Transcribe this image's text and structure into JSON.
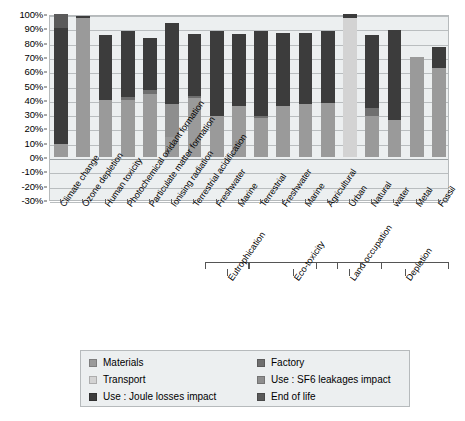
{
  "chart_data": {
    "type": "bar",
    "subtype": "stacked-bar-percentage",
    "title": "",
    "xlabel": "",
    "ylabel": "",
    "ylim": [
      -30,
      100
    ],
    "ytick_labels": [
      "100%",
      "90%",
      "80%",
      "70%",
      "60%",
      "50%",
      "40%",
      "30%",
      "20%",
      "10%",
      "0%",
      "-10%",
      "-20%",
      "-30%"
    ],
    "ytick_values": [
      100,
      90,
      80,
      70,
      60,
      50,
      40,
      30,
      20,
      10,
      0,
      -10,
      -20,
      -30
    ],
    "grid": true,
    "legend_position": "bottom",
    "categories": [
      "Climate change",
      "Ozone depletion",
      "Human toxicity",
      "Photochemical oxidant formation",
      "Particulate matter formation",
      "Ionising radiation",
      "Terrestrial acidification",
      "Freshwater",
      "Marine",
      "Terrestrial",
      "Freshwater",
      "Marine",
      "Agricultural",
      "Urban",
      "Natural",
      "water",
      "Metal",
      "Fossil"
    ],
    "series": [
      {
        "name": "Materials",
        "color": "#9a9a9a",
        "values": [
          9,
          97,
          40,
          40,
          44,
          14,
          41,
          37,
          36,
          28,
          37,
          39,
          39,
          0,
          33,
          28,
          70,
          62
        ]
      },
      {
        "name": "Factory",
        "color": "#6f6f6f",
        "values": [
          0,
          0,
          0,
          1.5,
          3,
          0,
          2,
          0,
          0,
          0,
          0,
          0,
          0,
          0,
          0,
          0,
          0,
          0
        ]
      },
      {
        "name": "Transport",
        "color": "#d3d3d3",
        "values": [
          0,
          0,
          0,
          0,
          0,
          0,
          0,
          0,
          0,
          0,
          0,
          0,
          0,
          97,
          0,
          0,
          0,
          0
        ]
      },
      {
        "name": "Use : SF6 leakages impact",
        "color": "#8e8e8e",
        "values": [
          0,
          0,
          0,
          0,
          0,
          23,
          0,
          0,
          0,
          0,
          0,
          0,
          0,
          0,
          0,
          0,
          0,
          0
        ]
      },
      {
        "name": "Use : Joule losses impact",
        "color": "#3c3c3c",
        "values": [
          81,
          1.5,
          45,
          46,
          36,
          57,
          43,
          47,
          50,
          60,
          52,
          50,
          50,
          3,
          52,
          57,
          0,
          16
        ]
      },
      {
        "name": "End of life",
        "color": "#5a5a5a",
        "values": [
          10,
          0,
          0,
          0,
          0,
          0,
          0,
          0,
          0,
          0,
          0,
          0,
          0,
          0,
          0,
          0,
          0,
          0
        ]
      }
    ],
    "bar_stacks": [
      {
        "category": "Climate change",
        "segments": [
          {
            "series": "Materials",
            "from": 0,
            "to": 9
          },
          {
            "series": "Use : Joule losses impact",
            "from": 9,
            "to": 90
          },
          {
            "series": "End of life",
            "from": 90,
            "to": 100
          }
        ]
      },
      {
        "category": "Ozone depletion",
        "segments": [
          {
            "series": "Materials",
            "from": 0,
            "to": 97
          },
          {
            "series": "Use : Joule losses impact",
            "from": 97,
            "to": 98.5
          }
        ]
      },
      {
        "category": "Human toxicity",
        "segments": [
          {
            "series": "Materials",
            "from": 0,
            "to": 40
          },
          {
            "series": "Use : Joule losses impact",
            "from": 40,
            "to": 85
          }
        ]
      },
      {
        "category": "Photochemical oxidant formation",
        "segments": [
          {
            "series": "Materials",
            "from": 0,
            "to": 40
          },
          {
            "series": "Factory",
            "from": 40,
            "to": 42
          },
          {
            "series": "Use : Joule losses impact",
            "from": 42,
            "to": 88
          }
        ]
      },
      {
        "category": "Particulate matter formation",
        "segments": [
          {
            "series": "Materials",
            "from": 0,
            "to": 44
          },
          {
            "series": "Factory",
            "from": 44,
            "to": 47
          },
          {
            "series": "Use : Joule losses impact",
            "from": 47,
            "to": 83
          }
        ]
      },
      {
        "category": "Ionising radiation",
        "segments": [
          {
            "series": "Materials",
            "from": 0,
            "to": 14
          },
          {
            "series": "Use : SF6 leakages impact",
            "from": 14,
            "to": 37
          },
          {
            "series": "Use : Joule losses impact",
            "from": 37,
            "to": 94
          }
        ]
      },
      {
        "category": "Terrestrial acidification",
        "segments": [
          {
            "series": "Materials",
            "from": 0,
            "to": 41
          },
          {
            "series": "Factory",
            "from": 41,
            "to": 43
          },
          {
            "series": "Use : Joule losses impact",
            "from": 43,
            "to": 86
          }
        ]
      },
      {
        "category": "Freshwater",
        "segments": [
          {
            "series": "Materials",
            "from": 0,
            "to": 29
          },
          {
            "series": "Use : Joule losses impact",
            "from": 29,
            "to": 88
          }
        ]
      },
      {
        "category": "Marine",
        "segments": [
          {
            "series": "Materials",
            "from": 0,
            "to": 36
          },
          {
            "series": "Use : Joule losses impact",
            "from": 36,
            "to": 86
          }
        ]
      },
      {
        "category": "Terrestrial",
        "segments": [
          {
            "series": "Materials",
            "from": 0,
            "to": 27
          },
          {
            "series": "Factory",
            "from": 27,
            "to": 29
          },
          {
            "series": "Use : Joule losses impact",
            "from": 29,
            "to": 88
          }
        ]
      },
      {
        "category": "Freshwater",
        "segments": [
          {
            "series": "Materials",
            "from": 0,
            "to": 36
          },
          {
            "series": "Use : Joule losses impact",
            "from": 36,
            "to": 87
          }
        ]
      },
      {
        "category": "Marine",
        "segments": [
          {
            "series": "Materials",
            "from": 0,
            "to": 37
          },
          {
            "series": "Use : Joule losses impact",
            "from": 37,
            "to": 87
          }
        ]
      },
      {
        "category": "Agricultural",
        "segments": [
          {
            "series": "Materials",
            "from": 0,
            "to": 38
          },
          {
            "series": "Use : Joule losses impact",
            "from": 38,
            "to": 88
          }
        ]
      },
      {
        "category": "Urban",
        "segments": [
          {
            "series": "Transport",
            "from": 0,
            "to": 97
          },
          {
            "series": "Use : Joule losses impact",
            "from": 97,
            "to": 100
          }
        ]
      },
      {
        "category": "Natural",
        "segments": [
          {
            "series": "Materials",
            "from": 0,
            "to": 29
          },
          {
            "series": "Factory",
            "from": 29,
            "to": 34
          },
          {
            "series": "Use : Joule losses impact",
            "from": 34,
            "to": 85
          }
        ]
      },
      {
        "category": "water",
        "segments": [
          {
            "series": "Materials",
            "from": 0,
            "to": 26
          },
          {
            "series": "Use : Joule losses impact",
            "from": 26,
            "to": 89
          }
        ]
      },
      {
        "category": "Metal",
        "segments": [
          {
            "series": "Materials",
            "from": 0,
            "to": 70
          }
        ]
      },
      {
        "category": "Fossil",
        "segments": [
          {
            "series": "Materials",
            "from": 0,
            "to": 62
          },
          {
            "series": "Use : Joule losses impact",
            "from": 62,
            "to": 77
          }
        ]
      }
    ],
    "groups": [
      {
        "label": "Eutrophication",
        "from_index": 7,
        "to_index": 8
      },
      {
        "label": "Eco-toxicity",
        "from_index": 9,
        "to_index": 12
      },
      {
        "label": "Land occupation",
        "from_index": 12,
        "to_index": 14
      },
      {
        "label": "Depletion",
        "from_index": 14,
        "to_index": 17
      }
    ],
    "legend": [
      {
        "label": "Materials",
        "color": "#9a9a9a"
      },
      {
        "label": "Factory",
        "color": "#6f6f6f"
      },
      {
        "label": "Transport",
        "color": "#d3d3d3"
      },
      {
        "label": "Use : SF6 leakages impact",
        "color": "#8e8e8e"
      },
      {
        "label": "Use : Joule losses impact",
        "color": "#3c3c3c"
      },
      {
        "label": "End of life",
        "color": "#5a5a5a"
      }
    ]
  },
  "colors": {
    "plot_background": "#eceff0",
    "gridline": "#b9bdbf",
    "border": "#b6babc",
    "text": "#000000"
  }
}
